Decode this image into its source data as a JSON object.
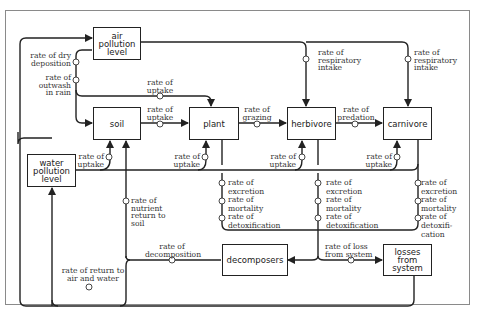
{
  "diagram": {
    "nodes": {
      "air": "air\npollution\nlevel",
      "soil": "soil",
      "plant": "plant",
      "herbivore": "herbivore",
      "carnivore": "carnivore",
      "water": "water\npollution\nlevel",
      "decomposers": "decomposers",
      "losses": "losses\nfrom\nsystem"
    },
    "labels": {
      "dry_deposition": "rate of dry\ndeposition",
      "outwash": "rate of\noutwash\nin rain",
      "air_to_plant_uptake": "rate of\nuptake",
      "soil_to_plant_uptake": "rate of\nuptake",
      "grazing": "rate of\ngrazing",
      "predation": "rate of\npredation",
      "resp_herbivore": "rate of\nrespiratory\nintake",
      "resp_carnivore": "rate of\nrespiratory\nintake",
      "water_soil_uptake": "rate of\nuptake",
      "water_plant_uptake": "rate of\nuptake",
      "water_herbivore_uptake": "rate of\nuptake",
      "water_carnivore_uptake": "rate of\nuptake",
      "plant_losses": "rate of\nexcretion\nrate of\nmortality\nrate of\ndetoxification",
      "herbivore_losses": "rate of\nexcretion\nrate of\nmortality\nrate of\ndetoxification",
      "carnivore_losses": "rate of\nexcretion\nrate of\nmortality\nrate of\ndetoxifi-\ncation",
      "nutrient_return": "rate of\nnutrient\nreturn to\nsoil",
      "decomposition": "rate of\ndecomposition",
      "loss_from_system": "rate of loss\nfrom system",
      "return_air_water": "rate of return to\nair and water"
    },
    "colors": {
      "line": "#222222",
      "text": "#333333",
      "frame": "#8a8a8a"
    }
  }
}
